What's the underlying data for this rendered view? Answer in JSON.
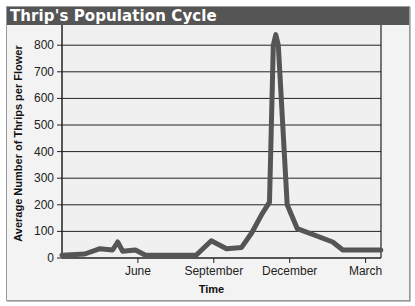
{
  "title": "Thrip's Population Cycle",
  "chart_data": {
    "type": "line",
    "title": "Thrip's Population Cycle",
    "xlabel": "Time",
    "ylabel": "Average Number of Thrips per Flower",
    "ylim": [
      0,
      850
    ],
    "yticks": [
      0,
      100,
      200,
      300,
      400,
      500,
      600,
      700,
      800
    ],
    "xtick_labels": [
      "June",
      "September",
      "December",
      "March"
    ],
    "grid": true,
    "legend": null,
    "series": [
      {
        "name": "Thrips per flower",
        "color": "#555555",
        "points": [
          {
            "t": "Mar",
            "x": 0.0,
            "y": 10
          },
          {
            "t": "Apr",
            "x": 0.9,
            "y": 15
          },
          {
            "t": "Apr-May",
            "x": 1.5,
            "y": 35
          },
          {
            "t": "May",
            "x": 2.0,
            "y": 30
          },
          {
            "t": "May",
            "x": 2.2,
            "y": 60
          },
          {
            "t": "May",
            "x": 2.4,
            "y": 25
          },
          {
            "t": "Jun",
            "x": 2.9,
            "y": 30
          },
          {
            "t": "Jun",
            "x": 3.3,
            "y": 10
          },
          {
            "t": "Aug",
            "x": 5.3,
            "y": 10
          },
          {
            "t": "Aug-Sep",
            "x": 5.9,
            "y": 65
          },
          {
            "t": "Sep",
            "x": 6.2,
            "y": 50
          },
          {
            "t": "Sep",
            "x": 6.5,
            "y": 35
          },
          {
            "t": "Oct",
            "x": 7.1,
            "y": 40
          },
          {
            "t": "Oct",
            "x": 7.5,
            "y": 95
          },
          {
            "t": "Nov",
            "x": 7.9,
            "y": 165
          },
          {
            "t": "Nov",
            "x": 8.2,
            "y": 210
          },
          {
            "t": "Nov",
            "x": 8.35,
            "y": 800
          },
          {
            "t": "Nov",
            "x": 8.45,
            "y": 840
          },
          {
            "t": "Nov",
            "x": 8.55,
            "y": 800
          },
          {
            "t": "Dec",
            "x": 8.9,
            "y": 200
          },
          {
            "t": "Dec",
            "x": 9.3,
            "y": 110
          },
          {
            "t": "Jan",
            "x": 10.7,
            "y": 60
          },
          {
            "t": "Feb",
            "x": 11.1,
            "y": 30
          },
          {
            "t": "Mar",
            "x": 12.6,
            "y": 30
          }
        ]
      }
    ]
  }
}
